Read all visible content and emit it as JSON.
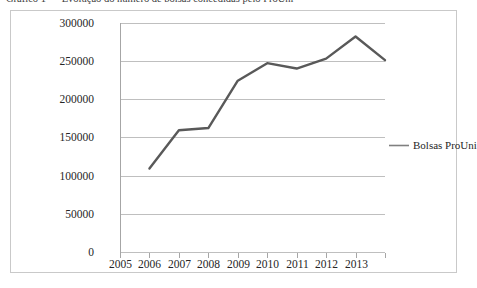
{
  "caption": {
    "text": "Gráfico 1 — Evolução do número de bolsas concedidas pelo ProUni"
  },
  "figure": {
    "background_color": "#ffffff",
    "frame_color": "#c9c9c9"
  },
  "chart_data": {
    "type": "line",
    "title": "",
    "subtitle": "",
    "xlabel": "",
    "ylabel": "",
    "grid": true,
    "grid_axis": "y",
    "grid_color": "#bfbfbf",
    "legend": {
      "position": "right",
      "entries": [
        "Bolsas ProUni"
      ],
      "swatch_color": "#808080"
    },
    "series": [
      {
        "name": "Bolsas ProUni",
        "color": "#595959",
        "line_width": 2.4,
        "x": [
          "2006",
          "2007",
          "2008",
          "2009",
          "2010",
          "2011",
          "2012",
          "2013",
          "2014"
        ],
        "values": [
          110000,
          160000,
          163000,
          225000,
          248000,
          241000,
          254000,
          283000,
          252000
        ]
      }
    ],
    "categories": [
      "2005",
      "2006",
      "2007",
      "2008",
      "2009",
      "2010",
      "2011",
      "2012",
      "2013"
    ],
    "xtick_labels": [
      "2005",
      "2006",
      "2007",
      "2008",
      "2009",
      "2010",
      "2011",
      "2012",
      "2013"
    ],
    "ytick_labels": [
      "0",
      "50000",
      "100000",
      "150000",
      "200000",
      "250000",
      "300000"
    ],
    "ytick_values": [
      0,
      50000,
      100000,
      150000,
      200000,
      250000,
      300000
    ],
    "ylim": [
      0,
      300000
    ],
    "xlim": [
      2005,
      2014
    ]
  }
}
